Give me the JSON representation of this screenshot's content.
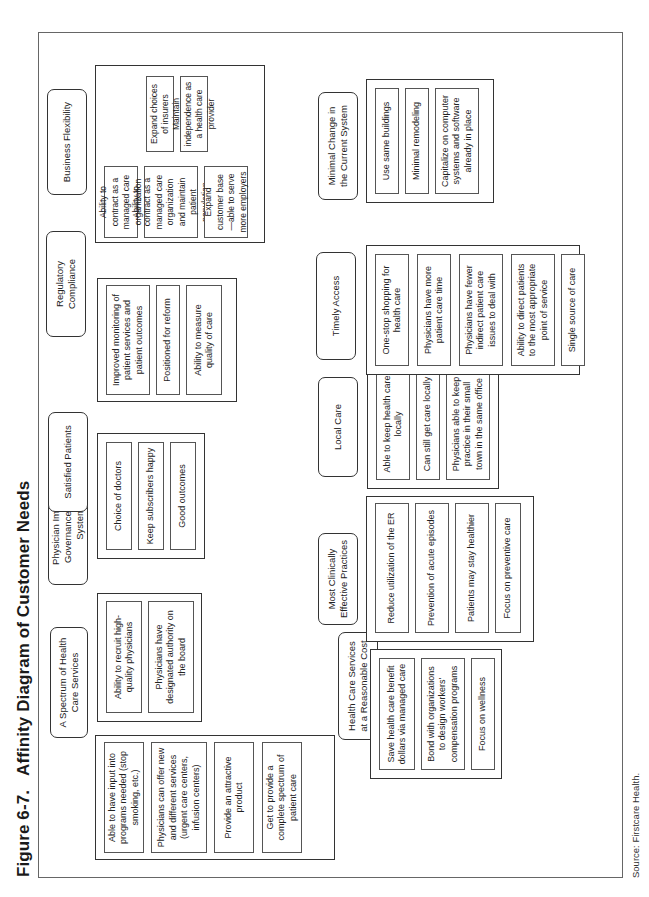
{
  "figure": {
    "label": "Figure 6-7.",
    "title": "Affinity Diagram of Customer Needs"
  },
  "groups": [
    {
      "header": "A Spectrum of Health Care Services",
      "items": [
        "Able to have input into programs needed (stop smoking, etc.)",
        "Physicians can offer new and different services (urgent care centers, infusion centers)",
        "Provide an attractive product",
        "Get to provide a complete spectrum of patient care"
      ]
    },
    {
      "header": "Physician Impact in Governance of the System",
      "items": [
        "Ability to recruit high-quality physicians",
        "Physicians have designated authority on the board"
      ]
    },
    {
      "header": "Satisfied Patients",
      "items": [
        "Choice of doctors",
        "Keep subscribers happy",
        "Good outcomes"
      ]
    },
    {
      "header": "Regulatory Compliance",
      "items": [
        "Improved monitoring of patient services and patient outcomes",
        "Positioned for reform",
        "Ability to measure quality of care"
      ]
    },
    {
      "header": "Business Flexibility",
      "items": [
        "Ability to contract as a managed care organization",
        "Ability to contract as a managed care organization and maintain patient population",
        "Expand customer base—able to serve more employers",
        "Expand choices of insurers",
        "Maintain independence as a health care provider"
      ]
    },
    {
      "header": "Health Care Services at a Reasonable Cost",
      "items": [
        "Save health care benefit dollars via managed care",
        "Bond with organizations to design workers' compensation programs",
        "Focus on wellness"
      ]
    },
    {
      "header": "Most Clinically Effective Practices",
      "items": [
        "Reduce utilization of the ER",
        "Prevention of acute episodes",
        "Patients may stay healthier",
        "Focus on preventive care"
      ]
    },
    {
      "header": "Local Care",
      "items": [
        "Able to keep health care locally",
        "Can still get care locally",
        "Physicians able to keep practice in their small town in the same office"
      ]
    },
    {
      "header": "Timely Access",
      "items": [
        "One-stop shopping for health care",
        "Physicians have more patient care time",
        "Physicians have fewer indirect patient care issues to deal with",
        "Ability to direct patients to the most appropriate point of service",
        "Single source of care"
      ]
    },
    {
      "header": "Minimal Change in the Current System",
      "items": [
        "Use same buildings",
        "Minimal remodeling",
        "Capitalize on computer systems and software already in place"
      ]
    }
  ],
  "source": "Source: Firstcare Health."
}
